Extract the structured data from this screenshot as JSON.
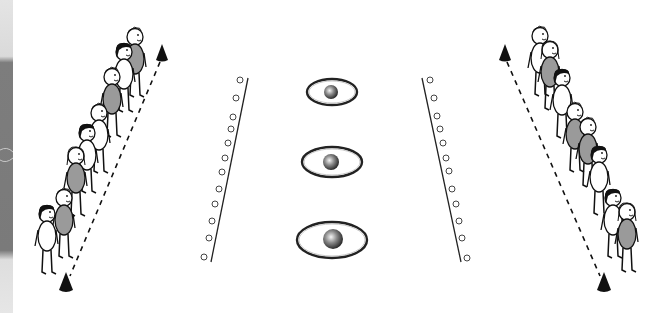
{
  "figure": {
    "colors": {
      "background": "#ffffff",
      "ink": "#111111",
      "grey_body": "#9a9a9a",
      "border_texture": "#7a7a7a",
      "border_light": "#d9d9d9"
    },
    "left_group": {
      "children_count": 8,
      "cones": [
        {
          "x": 162,
          "y": 55
        },
        {
          "x": 66,
          "y": 284
        }
      ],
      "dashed_line": {
        "from": [
          160,
          62
        ],
        "to": [
          70,
          276
        ]
      }
    },
    "right_group": {
      "children_count": 8,
      "cones": [
        {
          "x": 505,
          "y": 55
        },
        {
          "x": 604,
          "y": 284
        }
      ],
      "dashed_line": {
        "from": [
          507,
          62
        ],
        "to": [
          600,
          276
        ]
      }
    },
    "marker_rows": [
      {
        "side": "left",
        "line": {
          "from": [
            248,
            78
          ],
          "to": [
            211,
            262
          ]
        },
        "marker_count": 12
      },
      {
        "side": "right",
        "line": {
          "from": [
            422,
            78
          ],
          "to": [
            461,
            262
          ]
        },
        "marker_count": 12
      }
    ],
    "targets": [
      {
        "cx": 332,
        "cy": 92,
        "rx": 25,
        "ry": 13,
        "ball_r": 7
      },
      {
        "cx": 332,
        "cy": 162,
        "rx": 30,
        "ry": 15,
        "ball_r": 8
      },
      {
        "cx": 332,
        "cy": 240,
        "rx": 35,
        "ry": 18,
        "ball_r": 10
      }
    ]
  }
}
